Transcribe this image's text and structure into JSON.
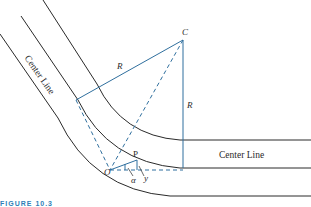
{
  "diagram": {
    "type": "horizontal-curve-geometry",
    "colors": {
      "road": "#2a2a2a",
      "geometry": "#2f6f9e",
      "caption": "#2e7fb8",
      "background": "#ffffff"
    },
    "labels": {
      "center_line_diagonal": "Center Line",
      "center_line_horizontal": "Center Line",
      "point_c": "C",
      "point_o": "O",
      "point_p": "P",
      "radius_upper": "R",
      "radius_vertical": "R",
      "angle": "α",
      "offset": "y"
    },
    "caption": "FIGURE 10.3"
  }
}
